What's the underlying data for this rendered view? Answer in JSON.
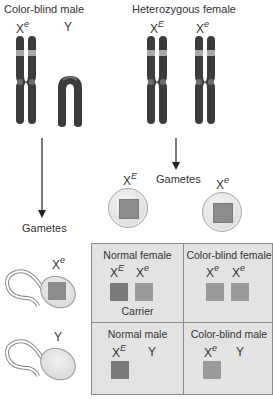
{
  "male": {
    "title": "Color-blind male",
    "chromosomes": [
      {
        "base": "X",
        "allele": "e",
        "label": "Xe"
      },
      {
        "base": "Y",
        "allele": "",
        "label": "Y"
      }
    ]
  },
  "female": {
    "title": "Heterozygous female",
    "chromosomes": [
      {
        "base": "X",
        "allele": "E",
        "label": "XE"
      },
      {
        "base": "X",
        "allele": "e",
        "label": "Xe"
      }
    ]
  },
  "gametes_label": "Gametes",
  "eggs": [
    {
      "base": "X",
      "allele": "E"
    },
    {
      "base": "X",
      "allele": "e"
    }
  ],
  "sperm": [
    {
      "base": "X",
      "allele": "e"
    },
    {
      "base": "Y",
      "allele": ""
    }
  ],
  "punnett": {
    "cells": [
      {
        "title": "Normal female",
        "alleles": [
          {
            "base": "X",
            "allele": "E"
          },
          {
            "base": "X",
            "allele": "e"
          }
        ],
        "note": "Carrier"
      },
      {
        "title": "Color-blind female",
        "alleles": [
          {
            "base": "X",
            "allele": "e"
          },
          {
            "base": "X",
            "allele": "e"
          }
        ],
        "note": ""
      },
      {
        "title": "Normal male",
        "alleles": [
          {
            "base": "X",
            "allele": "E"
          },
          {
            "base": "Y",
            "allele": ""
          }
        ],
        "note": ""
      },
      {
        "title": "Color-blind male",
        "alleles": [
          {
            "base": "X",
            "allele": "e"
          },
          {
            "base": "Y",
            "allele": ""
          }
        ],
        "note": ""
      }
    ]
  },
  "colors": {
    "chromosome": "#3c3c3c",
    "band": "#a9a9a9",
    "centromere": "#6e6e6e",
    "grid_bg": "#e3e3e3",
    "dominant_square": "#7a7a7a",
    "recessive_square": "#9a9a9a"
  }
}
